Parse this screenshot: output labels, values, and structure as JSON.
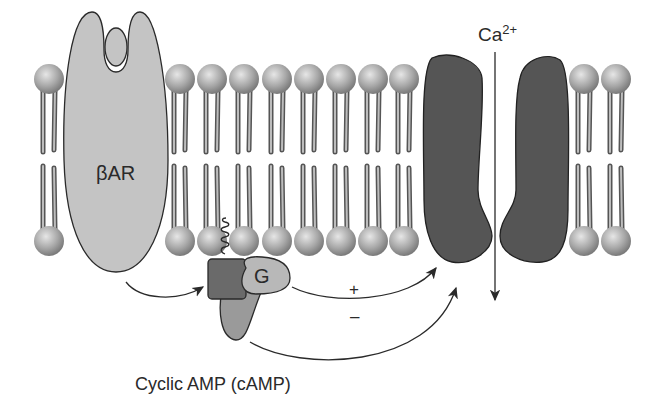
{
  "diagram": {
    "labels": {
      "receptor": "βAR",
      "g_protein": "G",
      "ion": "Ca",
      "ion_charge": "2+",
      "stimulatory": "+",
      "inhibitory": "–",
      "second_messenger": "Cyclic AMP (cAMP)"
    },
    "membrane": {
      "lipid_x": [
        49,
        180,
        212,
        244,
        277,
        309,
        341,
        373,
        404,
        584,
        616
      ],
      "top_head_y": 79,
      "bottom_head_y": 241
    },
    "colors": {
      "receptor_fill": "#c4c4c4",
      "channel_fill": "#555555",
      "adenylyl_cyclase_fill": "#6a6a6a",
      "g_protein_fill": "#b8b8b8",
      "effector_tail_fill": "#9a9a9a",
      "lipid_head": "#a8a8a8",
      "line": "#2a2a2a"
    }
  }
}
